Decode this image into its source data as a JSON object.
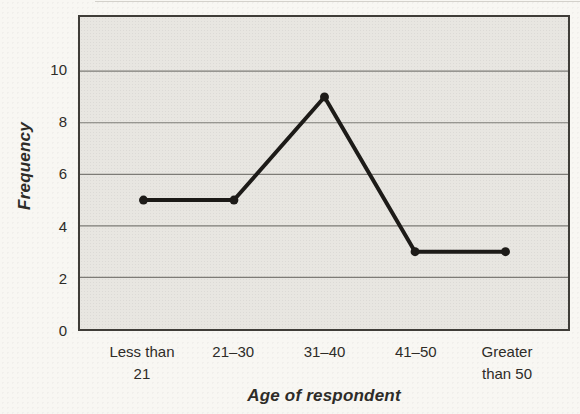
{
  "chart_data": {
    "type": "line",
    "title": "",
    "categories": [
      "Less than 21",
      "21–30",
      "31–40",
      "41–50",
      "Greater than 50"
    ],
    "values": [
      5,
      5,
      9,
      3,
      3
    ],
    "series": [
      {
        "name": "Frequency",
        "values": [
          5,
          5,
          9,
          3,
          3
        ]
      }
    ],
    "xlabel": "Age of respondent",
    "ylabel": "Frequency",
    "yticks": [
      0,
      2,
      4,
      6,
      8,
      10
    ],
    "ylim": [
      0,
      12.1
    ],
    "grid": "horizontal",
    "legend": "none",
    "colors": {
      "line": "#1d1b18",
      "marker": "#1d1b18",
      "plot_background": "#e8e6e1",
      "gridline": "#7d7b76",
      "border": "#3f3d38",
      "text": "#2e2c28"
    }
  }
}
